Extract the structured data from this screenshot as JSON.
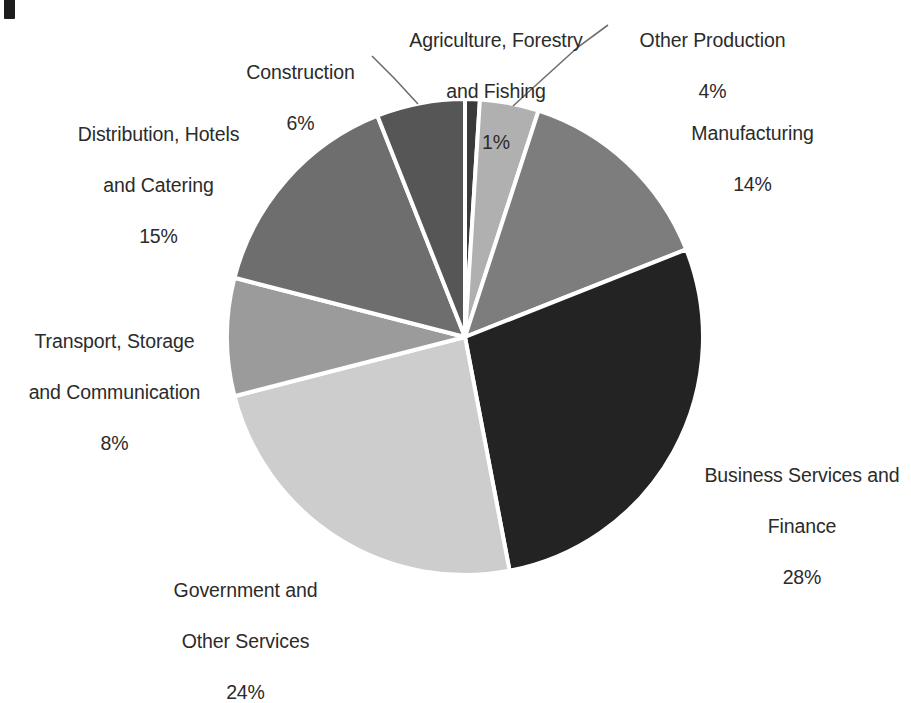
{
  "page": {
    "background_color": "#ffffff",
    "text_color": "#2b2b2b",
    "artifact_label": ""
  },
  "chart_data": {
    "type": "pie",
    "title": "",
    "subtitle": "",
    "xlabel": "",
    "ylabel": "",
    "units": "percent",
    "legend_position": "none",
    "labels_position": "outside",
    "grid": false,
    "start_angle_deg": 0,
    "direction": "clockwise",
    "center": {
      "x": 465,
      "y": 337
    },
    "radius": 238,
    "separator_color": "#ffffff",
    "separator_width": 4,
    "categories": [
      "Agriculture, Forestry and Fishing",
      "Other Production",
      "Manufacturing",
      "Business Services and Finance",
      "Government and Other Services",
      "Transport, Storage and Communication",
      "Distribution, Hotels and Catering",
      "Construction"
    ],
    "values": [
      1,
      4,
      14,
      28,
      24,
      8,
      15,
      6
    ],
    "value_labels": [
      "1%",
      "4%",
      "14%",
      "28%",
      "24%",
      "8%",
      "15%",
      "6%"
    ],
    "colors": [
      "#3a3a3a",
      "#b0b0b0",
      "#7d7d7d",
      "#232323",
      "#cdcdcd",
      "#9b9b9b",
      "#6e6e6e",
      "#565656"
    ],
    "slices": [
      {
        "name": "Agriculture, Forestry and Fishing",
        "label_line1": "Agriculture, Forestry",
        "label_line2": "and Fishing",
        "value": 1,
        "value_label": "1%",
        "color": "#3a3a3a",
        "start_deg": 0,
        "end_deg": 3.6,
        "leader_line": false
      },
      {
        "name": "Other Production",
        "label_line1": "Other Production",
        "label_line2": "",
        "value": 4,
        "value_label": "4%",
        "color": "#b0b0b0",
        "start_deg": 3.6,
        "end_deg": 18.0,
        "leader_line": true
      },
      {
        "name": "Manufacturing",
        "label_line1": "Manufacturing",
        "label_line2": "",
        "value": 14,
        "value_label": "14%",
        "color": "#7d7d7d",
        "start_deg": 18.0,
        "end_deg": 68.4,
        "leader_line": false
      },
      {
        "name": "Business Services and Finance",
        "label_line1": "Business Services and",
        "label_line2": "Finance",
        "value": 28,
        "value_label": "28%",
        "color": "#232323",
        "start_deg": 68.4,
        "end_deg": 169.2,
        "leader_line": false
      },
      {
        "name": "Government and Other Services",
        "label_line1": "Government and",
        "label_line2": "Other Services",
        "value": 24,
        "value_label": "24%",
        "color": "#cdcdcd",
        "start_deg": 169.2,
        "end_deg": 255.6,
        "leader_line": false
      },
      {
        "name": "Transport, Storage and Communication",
        "label_line1": "Transport, Storage",
        "label_line2": "and Communication",
        "value": 8,
        "value_label": "8%",
        "color": "#9b9b9b",
        "start_deg": 255.6,
        "end_deg": 284.4,
        "leader_line": false
      },
      {
        "name": "Distribution, Hotels and Catering",
        "label_line1": "Distribution, Hotels",
        "label_line2": "and Catering",
        "value": 15,
        "value_label": "15%",
        "color": "#6e6e6e",
        "start_deg": 284.4,
        "end_deg": 338.4,
        "leader_line": false
      },
      {
        "name": "Construction",
        "label_line1": "Construction",
        "label_line2": "",
        "value": 6,
        "value_label": "6%",
        "color": "#565656",
        "start_deg": 338.4,
        "end_deg": 360.0,
        "leader_line": true
      }
    ],
    "leader_lines": [
      {
        "name": "construction-leader",
        "x1": 418,
        "y1": 104,
        "x2": 394,
        "y2": 78,
        "x3": 372,
        "y3": 56
      },
      {
        "name": "other-production-leader",
        "x1": 513,
        "y1": 106,
        "x2": 578,
        "y2": 47,
        "x3": 608,
        "y3": 25
      }
    ]
  },
  "labels": {
    "agriculture": {
      "line1": "Agriculture, Forestry",
      "line2": "and Fishing",
      "value": "1%"
    },
    "other_production": {
      "line1": "Other Production",
      "line2": "",
      "value": "4%"
    },
    "construction": {
      "line1": "Construction",
      "line2": "",
      "value": "6%"
    },
    "manufacturing": {
      "line1": "Manufacturing",
      "line2": "",
      "value": "14%"
    },
    "distribution": {
      "line1": "Distribution, Hotels",
      "line2": "and Catering",
      "value": "15%"
    },
    "transport": {
      "line1": "Transport, Storage",
      "line2": "and Communication",
      "value": "8%"
    },
    "business": {
      "line1": "Business Services and",
      "line2": "Finance",
      "value": "28%"
    },
    "government": {
      "line1": "Government and",
      "line2": "Other Services",
      "value": "24%"
    }
  }
}
